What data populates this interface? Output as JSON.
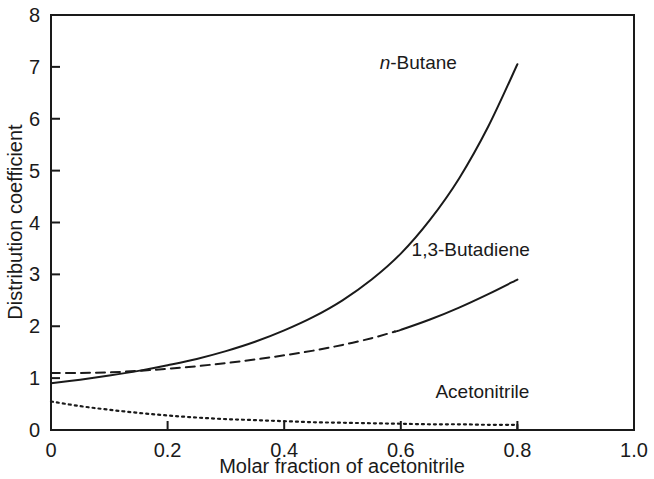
{
  "chart_data": {
    "type": "line",
    "title": "",
    "subtitle": "",
    "xlabel": "Molar fraction of acetonitrile",
    "ylabel": "Distribution coefficient",
    "xlim": [
      0.0,
      1.0
    ],
    "ylim": [
      0,
      8
    ],
    "grid": false,
    "legend_position": "inline-annotations",
    "x_ticks": [
      "0",
      "0.2",
      "0.4",
      "0.6",
      "0.8",
      "1.0"
    ],
    "x_tick_values": [
      0.0,
      0.2,
      0.4,
      0.6,
      0.8,
      1.0
    ],
    "y_ticks": [
      "0",
      "1",
      "2",
      "3",
      "4",
      "5",
      "6",
      "7",
      "8"
    ],
    "y_tick_values": [
      0,
      1,
      2,
      3,
      4,
      5,
      6,
      7,
      8
    ],
    "series": [
      {
        "name": "n-Butane",
        "style": "solid",
        "x": [
          0.0,
          0.05,
          0.1,
          0.15,
          0.2,
          0.25,
          0.3,
          0.35,
          0.4,
          0.45,
          0.5,
          0.55,
          0.6,
          0.65,
          0.7,
          0.75,
          0.8
        ],
        "values": [
          0.9,
          0.97,
          1.05,
          1.14,
          1.25,
          1.37,
          1.52,
          1.7,
          1.92,
          2.18,
          2.5,
          2.9,
          3.4,
          4.05,
          4.85,
          5.85,
          7.05
        ]
      },
      {
        "name": "1,3-Butadiene",
        "style": "dashed-then-solid",
        "dash_until_x": 0.59,
        "x": [
          0.0,
          0.05,
          0.1,
          0.15,
          0.2,
          0.25,
          0.3,
          0.35,
          0.4,
          0.45,
          0.5,
          0.55,
          0.6,
          0.65,
          0.7,
          0.75,
          0.8
        ],
        "values": [
          1.1,
          1.1,
          1.11,
          1.14,
          1.18,
          1.23,
          1.29,
          1.36,
          1.44,
          1.53,
          1.64,
          1.77,
          1.93,
          2.13,
          2.36,
          2.62,
          2.9
        ]
      },
      {
        "name": "Acetonitrile",
        "style": "dotted",
        "x": [
          0.0,
          0.05,
          0.1,
          0.15,
          0.2,
          0.25,
          0.3,
          0.35,
          0.4,
          0.45,
          0.5,
          0.55,
          0.6,
          0.65,
          0.7,
          0.75,
          0.8
        ],
        "values": [
          0.55,
          0.46,
          0.39,
          0.33,
          0.28,
          0.24,
          0.21,
          0.19,
          0.17,
          0.15,
          0.14,
          0.13,
          0.12,
          0.11,
          0.11,
          0.1,
          0.1
        ]
      }
    ],
    "annotations": [
      {
        "text": "n-Butane",
        "text_italic_prefix": "n",
        "text_rest": "-Butane",
        "x": 0.63,
        "y": 6.95
      },
      {
        "text": "1,3-Butadiene",
        "x": 0.72,
        "y": 3.35
      },
      {
        "text": "Acetonitrile",
        "x": 0.74,
        "y": 0.62
      }
    ],
    "colors": {
      "axis": "#1a1a1a",
      "curve": "#1a1a1a",
      "background": "#ffffff"
    }
  }
}
